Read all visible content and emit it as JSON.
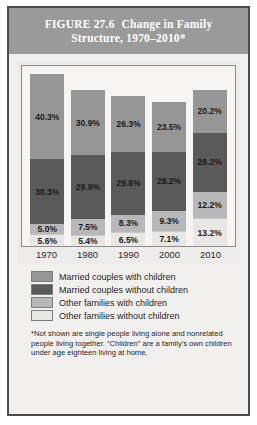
{
  "figure": {
    "number": "FIGURE 27.6",
    "title": "Change in Family Structure, 1970–2010*"
  },
  "footnote": "*Not shown are single people living alone and nonrelated people living together. “Children” are a family's own children under age eighteen living at home.",
  "colors": {
    "married_with_children": "#969696",
    "married_without_children": "#5a5a5a",
    "other_with_children": "#b8b8b8",
    "other_without_children": "#e9e7e4",
    "title_band": "#9a9a9a",
    "frame": "#4c4c4c"
  },
  "legend": {
    "items": [
      {
        "label": "Married couples with children",
        "color": "#969696"
      },
      {
        "label": "Married couples without children",
        "color": "#5a5a5a"
      },
      {
        "label": "Other families with children",
        "color": "#b8b8b8"
      },
      {
        "label": "Other families without children",
        "color": "#e9e7e4"
      }
    ]
  },
  "chart_data": {
    "type": "bar",
    "title": "Change in Family Structure, 1970–2010*",
    "xlabel": "",
    "ylabel": "",
    "stacked": true,
    "grid": false,
    "legend_position": "bottom",
    "categories": [
      "1970",
      "1980",
      "1990",
      "2000",
      "2010"
    ],
    "series": [
      {
        "name": "Married couples with children",
        "color": "#969696",
        "values": [
          40.3,
          30.9,
          26.3,
          23.5,
          20.2
        ],
        "labels": [
          "40.3%",
          "30.9%",
          "26.3%",
          "23.5%",
          "20.2%"
        ]
      },
      {
        "name": "Married couples without children",
        "color": "#5a5a5a",
        "values": [
          30.3,
          29.9,
          29.8,
          28.2,
          28.2
        ],
        "labels": [
          "30.3%",
          "29.9%",
          "29.8%",
          "28.2%",
          "28.2%"
        ]
      },
      {
        "name": "Other families with children",
        "color": "#b8b8b8",
        "values": [
          5.0,
          7.5,
          8.3,
          9.3,
          12.2
        ],
        "labels": [
          "5.0%",
          "7.5%",
          "8.3%",
          "9.3%",
          "12.2%"
        ]
      },
      {
        "name": "Other families without children",
        "color": "#e9e7e4",
        "values": [
          5.6,
          5.4,
          6.5,
          7.1,
          13.2
        ],
        "labels": [
          "5.6%",
          "5.4%",
          "6.5%",
          "7.1%",
          "13.2%"
        ]
      }
    ],
    "totals": [
      81.2,
      73.7,
      70.9,
      68.1,
      73.8
    ],
    "ylim": [
      0,
      85
    ]
  }
}
